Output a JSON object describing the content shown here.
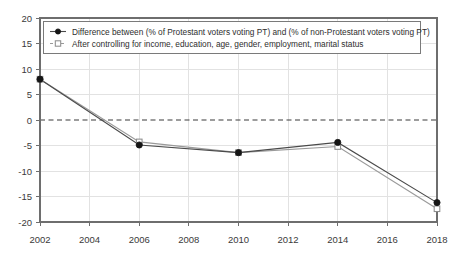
{
  "chart_data": {
    "type": "line",
    "title": "",
    "xlabel": "",
    "ylabel": "",
    "x": [
      2002,
      2006,
      2010,
      2014,
      2018
    ],
    "xtick_labels": [
      "2002",
      "2004",
      "2006",
      "2008",
      "2010",
      "2012",
      "2014",
      "2016",
      "2018"
    ],
    "xticks": [
      2002,
      2004,
      2006,
      2008,
      2010,
      2012,
      2014,
      2016,
      2018
    ],
    "ytick_labels": [
      "20",
      "15",
      "10",
      "5",
      "0",
      "-5",
      "-10",
      "-15",
      "-20"
    ],
    "yticks": [
      20,
      15,
      10,
      5,
      0,
      -5,
      -10,
      -15,
      -20
    ],
    "xlim": [
      2002,
      2018
    ],
    "ylim": [
      -20,
      20
    ],
    "grid": true,
    "zero_line": true,
    "legend_position": "top-center",
    "series": [
      {
        "name": "Difference between (% of Protestant voters voting PT) and (% of non-Protestant voters voting PT)",
        "marker": "filled-circle",
        "linestyle": "solid",
        "color": "#4a4a4a",
        "values": [
          8.0,
          -4.9,
          -6.4,
          -4.4,
          -16.2
        ]
      },
      {
        "name": "After controlling for income, education, age, gender, employment, marital status",
        "marker": "hollow-square",
        "linestyle": "solid",
        "color": "#9a9a9a",
        "values": [
          8.0,
          -4.3,
          -6.4,
          -5.2,
          -17.4
        ]
      }
    ]
  },
  "legend": {
    "entries": [
      {
        "label": "Difference between (% of Protestant voters voting PT) and (% of non-Protestant voters voting PT)",
        "marker": "filled-circle-icon"
      },
      {
        "label": "After controlling for income, education, age, gender, employment, marital status",
        "marker": "hollow-square-icon"
      }
    ]
  },
  "axis": {
    "y_labels": [
      "20",
      "15",
      "10",
      "5",
      "0",
      "-5",
      "-10",
      "-15",
      "-20"
    ],
    "x_labels": [
      "2002",
      "2004",
      "2006",
      "2008",
      "2010",
      "2012",
      "2014",
      "2016",
      "2018"
    ]
  },
  "colors": {
    "series_main": "#4a4a4a",
    "series_control": "#9a9a9a",
    "grid": "#e2e2e2",
    "frame": "#6e6e6e",
    "zero_line": "#3b3b3b",
    "text": "#3a3a3a",
    "background": "#ffffff"
  }
}
